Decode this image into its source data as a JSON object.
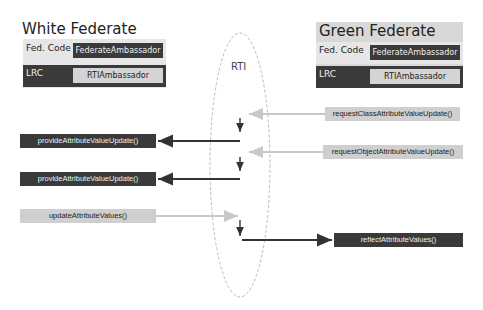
{
  "white_federate": {
    "title": "White Federate",
    "fed_code_label": "Fed. Code",
    "fed_code_value": "FederateAmbassador",
    "lrc_label": "LRC",
    "lrc_value": "RTIAmbassador"
  },
  "green_federate": {
    "title": "Green Federate",
    "fed_code_label": "Fed. Code",
    "fed_code_value": "FederateAmbassador",
    "lrc_label": "LRC",
    "lrc_value": "RTIAmbassador"
  },
  "rti": {
    "label": "RTI"
  },
  "messages": {
    "request_class": "requestClassAttributeValueUpdate()",
    "provide_1": "provideAttributeValueUpdate()",
    "request_object": "requestObjectAttributeValueUpdate()",
    "provide_2": "provideAttributeValueUpdate()",
    "update": "updateAttributeValues()",
    "reflect": "reflectAttributeValues()"
  },
  "colors": {
    "dark_box": "#3a3a3a",
    "light_box": "#d4d4d4",
    "panel_bg": "#e6e6e6",
    "light_arrow": "#c8c8c8",
    "dark_arrow": "#333333",
    "rti_ellipse": "#bbbbbb"
  }
}
